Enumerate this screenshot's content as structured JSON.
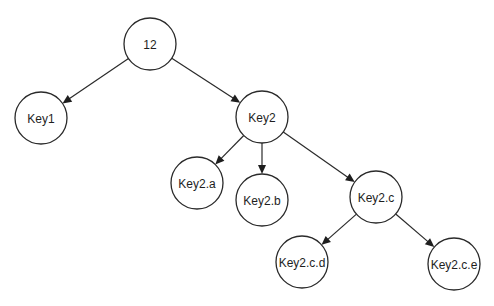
{
  "diagram": {
    "type": "tree",
    "width": 494,
    "height": 306,
    "node_radius": 26,
    "colors": {
      "stroke": "#2a2a2a",
      "fill": "#ffffff",
      "text": "#1e1e1e",
      "background": "#ffffff"
    },
    "nodes": [
      {
        "id": "root",
        "label": "12",
        "x": 150,
        "y": 44
      },
      {
        "id": "key1",
        "label": "Key1",
        "x": 41,
        "y": 118
      },
      {
        "id": "key2",
        "label": "Key2",
        "x": 262,
        "y": 117
      },
      {
        "id": "key2a",
        "label": "Key2.a",
        "x": 197,
        "y": 183
      },
      {
        "id": "key2b",
        "label": "Key2.b",
        "x": 262,
        "y": 200
      },
      {
        "id": "key2c",
        "label": "Key2.c",
        "x": 376,
        "y": 197
      },
      {
        "id": "key2cd",
        "label": "Key2.c.d",
        "x": 302,
        "y": 262
      },
      {
        "id": "key2ce",
        "label": "Key2.c.e",
        "x": 454,
        "y": 264
      }
    ],
    "edges": [
      {
        "from": "root",
        "to": "key1"
      },
      {
        "from": "root",
        "to": "key2"
      },
      {
        "from": "key2",
        "to": "key2a"
      },
      {
        "from": "key2",
        "to": "key2b"
      },
      {
        "from": "key2",
        "to": "key2c"
      },
      {
        "from": "key2c",
        "to": "key2cd"
      },
      {
        "from": "key2c",
        "to": "key2ce"
      }
    ]
  }
}
